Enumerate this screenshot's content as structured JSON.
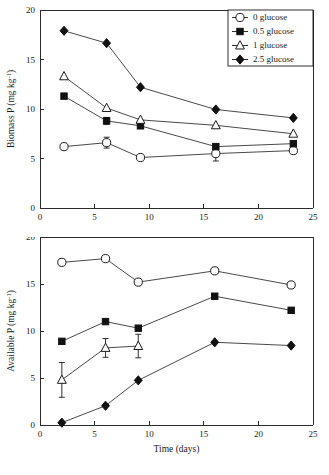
{
  "figure": {
    "background": "#ffffff",
    "ink": "#1a1a1a"
  },
  "legend": {
    "position": "top-right",
    "panel": "top",
    "entries": [
      {
        "label": "0 glucose",
        "marker": "open-circle",
        "name": "legend-item-0-glucose"
      },
      {
        "label": "0.5 glucose",
        "marker": "filled-square",
        "name": "legend-item-05-glucose"
      },
      {
        "label": "1 glucose",
        "marker": "open-triangle",
        "name": "legend-item-1-glucose"
      },
      {
        "label": "2.5 glucose",
        "marker": "filled-diamond",
        "name": "legend-item-25-glucose"
      }
    ]
  },
  "chart_data": [
    {
      "id": "biomass-p",
      "type": "line",
      "title": "",
      "xlabel": "",
      "ylabel": "Biomass P (mg kg",
      "ylabel_sup": "-1",
      "ylabel_tail": ")",
      "xlim": [
        0,
        25
      ],
      "ylim": [
        0,
        20
      ],
      "xticks": [
        0,
        5,
        10,
        15,
        20,
        25
      ],
      "yticks": [
        0,
        5,
        10,
        15,
        20
      ],
      "grid": false,
      "series": [
        {
          "name": "0 glucose",
          "marker": "open-circle",
          "x": [
            2.2,
            6.1,
            9.2,
            16.1,
            23.2
          ],
          "values": [
            6.2,
            6.6,
            5.1,
            5.5,
            5.8
          ],
          "errors": [
            0,
            0.55,
            0,
            0.75,
            0
          ]
        },
        {
          "name": "0.5 glucose",
          "marker": "filled-square",
          "x": [
            2.2,
            6.1,
            9.2,
            16.1,
            23.2
          ],
          "values": [
            11.3,
            8.8,
            8.3,
            6.2,
            6.5
          ],
          "errors": [
            0,
            0.35,
            0,
            0,
            0
          ]
        },
        {
          "name": "1 glucose",
          "marker": "open-triangle",
          "x": [
            2.2,
            6.1,
            9.2,
            16.1,
            23.2
          ],
          "values": [
            13.3,
            10.1,
            8.9,
            8.35,
            7.5
          ],
          "errors": [
            0,
            0,
            0,
            0,
            0
          ]
        },
        {
          "name": "2.5 glucose",
          "marker": "filled-diamond",
          "x": [
            2.2,
            6.1,
            9.2,
            16.1,
            23.2
          ],
          "values": [
            17.9,
            16.65,
            12.2,
            9.95,
            9.1
          ],
          "errors": [
            0,
            0,
            0,
            0,
            0
          ]
        }
      ]
    },
    {
      "id": "available-p",
      "type": "line",
      "title": "",
      "xlabel": "Time (days)",
      "ylabel": "Available P (mg kg",
      "ylabel_sup": "-1",
      "ylabel_tail": ")",
      "xlim": [
        0,
        25
      ],
      "ylim": [
        0,
        20
      ],
      "xticks": [
        0,
        5,
        10,
        15,
        20,
        25
      ],
      "yticks": [
        0,
        5,
        10,
        15,
        20
      ],
      "grid": false,
      "series": [
        {
          "name": "0 glucose",
          "marker": "open-circle",
          "x": [
            2.0,
            6.0,
            9.0,
            16.0,
            23.0
          ],
          "values": [
            17.3,
            17.7,
            15.2,
            16.4,
            14.9
          ],
          "errors": [
            0,
            0,
            0,
            0,
            0
          ]
        },
        {
          "name": "0.5 glucose",
          "marker": "filled-square",
          "x": [
            2.0,
            6.0,
            9.0,
            16.0,
            23.0
          ],
          "values": [
            8.9,
            11.0,
            10.3,
            13.7,
            12.2
          ],
          "errors": [
            0,
            0,
            0,
            0,
            0
          ]
        },
        {
          "name": "1 glucose",
          "marker": "open-triangle",
          "x": [
            2.0,
            6.0,
            9.0
          ],
          "values": [
            4.8,
            8.2,
            8.4
          ],
          "errors": [
            1.85,
            1.0,
            1.25
          ]
        },
        {
          "name": "2.5 glucose",
          "marker": "filled-diamond",
          "x": [
            2.0,
            6.0,
            9.0,
            16.0,
            23.0
          ],
          "values": [
            0.25,
            2.05,
            4.75,
            8.8,
            8.45
          ],
          "errors": [
            0,
            0,
            0,
            0,
            0
          ]
        }
      ]
    }
  ]
}
